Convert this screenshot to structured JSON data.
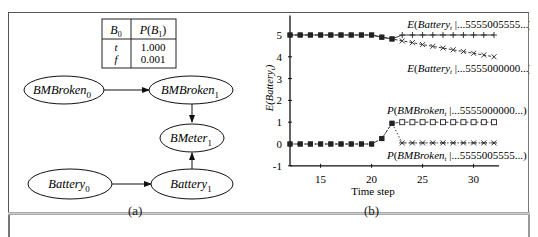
{
  "panel_a": {
    "caption": "(a)",
    "cpt_table": {
      "headers": [
        "B0",
        "P(B1)"
      ],
      "rows": [
        {
          "b0": "t",
          "p": "1.000"
        },
        {
          "b0": "f",
          "p": "0.001"
        }
      ]
    },
    "nodes": [
      {
        "id": "bmbroken0",
        "base": "BMBroken",
        "sub": "0"
      },
      {
        "id": "bmbroken1",
        "base": "BMBroken",
        "sub": "1"
      },
      {
        "id": "bmeter1",
        "base": "BMeter",
        "sub": "1"
      },
      {
        "id": "battery0",
        "base": "Battery",
        "sub": "0"
      },
      {
        "id": "battery1",
        "base": "Battery",
        "sub": "1"
      }
    ],
    "edges": [
      [
        "bmbroken0",
        "bmbroken1"
      ],
      [
        "bmbroken1",
        "bmeter1"
      ],
      [
        "battery0",
        "battery1"
      ],
      [
        "battery1",
        "bmeter1"
      ]
    ]
  },
  "panel_b": {
    "caption": "(b)"
  },
  "chart_data": {
    "type": "line",
    "title": "",
    "xlabel": "Time step",
    "ylabel": "E(Battery_t)",
    "xlim": [
      12,
      32.5
    ],
    "ylim": [
      -1,
      5.9
    ],
    "xticks": [
      15,
      20,
      25,
      30
    ],
    "yticks": [
      -1,
      0,
      1,
      2,
      3,
      4,
      5
    ],
    "grid": false,
    "x": [
      12,
      13,
      14,
      15,
      16,
      17,
      18,
      19,
      20,
      21,
      22,
      23,
      24,
      25,
      26,
      27,
      28,
      29,
      30,
      31,
      32
    ],
    "series": [
      {
        "name": "E(Battery_t |...5555005555...)",
        "marker": "plus",
        "line": "solid",
        "values": [
          5,
          5,
          5,
          5,
          5,
          5,
          5,
          5,
          5,
          4.9,
          4.82,
          5,
          5,
          5,
          5,
          5,
          5,
          5,
          5,
          5,
          5
        ]
      },
      {
        "name": "E(Battery_t |...5555000000...)",
        "marker": "x",
        "line": "dashed",
        "values": [
          5,
          5,
          5,
          5,
          5,
          5,
          5,
          5,
          5,
          4.9,
          4.82,
          4.73,
          4.65,
          4.56,
          4.48,
          4.4,
          4.32,
          4.24,
          4.16,
          4.08,
          4.0
        ]
      },
      {
        "name": "P(BMBroken_t |...5555000000...)",
        "marker": "square-open",
        "line": "dashed",
        "values": [
          0,
          0,
          0,
          0,
          0,
          0,
          0,
          0,
          0,
          0.25,
          0.95,
          1,
          1,
          1,
          1,
          1,
          1,
          1,
          1,
          1,
          1
        ]
      },
      {
        "name": "P(BMBroken_t |...5555005555...)",
        "marker": "star",
        "line": "dotted",
        "values": [
          0,
          0,
          0,
          0,
          0,
          0,
          0,
          0,
          0,
          0.25,
          0.95,
          0.05,
          0.05,
          0.05,
          0.05,
          0.05,
          0.05,
          0.05,
          0.05,
          0.05,
          0.05
        ]
      }
    ],
    "annotations": [
      {
        "text": "E(Battery_t |...5555005555...)",
        "x": 23.5,
        "y": 5.5
      },
      {
        "text": "E(Battery_t |...5555000000...)",
        "x": 23.5,
        "y": 3.5
      },
      {
        "text": "P(BMBroken_t |...5555000000...)",
        "x": 21.5,
        "y": 1.55
      },
      {
        "text": "P(BMBroken_t |...5555005555...)",
        "x": 21.5,
        "y": -0.5
      }
    ],
    "legend": "inline annotations"
  }
}
